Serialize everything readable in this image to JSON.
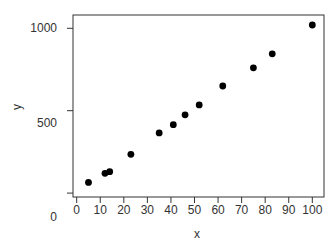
{
  "chart_data": {
    "type": "scatter",
    "title": "",
    "xlabel": "x",
    "ylabel": "y",
    "xlim": [
      0,
      105
    ],
    "ylim": [
      0,
      1050
    ],
    "x_ticks": [
      0,
      10,
      20,
      30,
      40,
      50,
      60,
      70,
      80,
      90,
      100
    ],
    "x_tick_labels": [
      "0",
      "10",
      "20",
      "30",
      "40",
      "50",
      "60",
      "70",
      "80",
      "90",
      "100"
    ],
    "y_ticks": [
      0,
      500,
      1000
    ],
    "y_tick_labels": [
      "0",
      "500",
      "1000"
    ],
    "grid": false,
    "legend": null,
    "series": [
      {
        "name": "points",
        "color": "#000000",
        "x": [
          5,
          12,
          14,
          23,
          35,
          41,
          46,
          52,
          62,
          75,
          83,
          100
        ],
        "y": [
          65,
          120,
          130,
          235,
          365,
          415,
          475,
          535,
          650,
          760,
          845,
          1020
        ]
      }
    ]
  },
  "layout": {
    "box": {
      "left": 73,
      "top": 15,
      "right": 324,
      "bottom": 197
    },
    "x_px": {
      "v0": 76.7,
      "per_unit": 2.356
    },
    "y_px": {
      "v0": 193.1,
      "per_unit": 0.1648
    },
    "y_label_offsets": {
      "0": 24,
      "500": 12,
      "1000": 0
    }
  }
}
